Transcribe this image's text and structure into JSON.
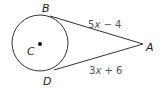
{
  "diagram": {
    "type": "circle-tangent-segments",
    "circle": {
      "center_label": "C",
      "cx": 40,
      "cy": 43,
      "r": 28
    },
    "points": {
      "B": {
        "label": "B",
        "x": 50,
        "y": 16
      },
      "D": {
        "label": "D",
        "x": 54,
        "y": 70
      },
      "A": {
        "label": "A",
        "x": 143,
        "y": 44
      }
    },
    "segments": [
      {
        "from": "B",
        "to": "A",
        "expression": "5x − 4",
        "coef": "5",
        "var": "x",
        "rest": " − 4"
      },
      {
        "from": "D",
        "to": "A",
        "expression": "3x + 6",
        "coef": "3",
        "var": "x",
        "rest": " + 6"
      }
    ],
    "colors": {
      "stroke": "#333333",
      "label": "#222222",
      "expression": "#555555"
    }
  }
}
